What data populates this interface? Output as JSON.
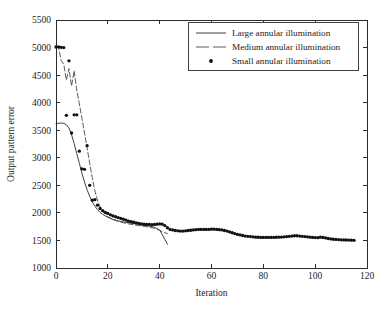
{
  "chart_data": {
    "type": "line",
    "title": "",
    "xlabel": "Iteration",
    "ylabel": "Output pattern error",
    "xlim": [
      0,
      120
    ],
    "ylim": [
      1000,
      5500
    ],
    "xticks": [
      0,
      20,
      40,
      60,
      80,
      100,
      120
    ],
    "yticks": [
      1000,
      1500,
      2000,
      2500,
      3000,
      3500,
      4000,
      4500,
      5000,
      5500
    ],
    "xtick_labels": [
      "0",
      "20",
      "40",
      "60",
      "80",
      "100",
      "120"
    ],
    "ytick_labels": [
      "1000",
      "1500",
      "2000",
      "2500",
      "3000",
      "3500",
      "4000",
      "4500",
      "5000",
      "5500"
    ],
    "grid": false,
    "legend_position": "top-right",
    "series": [
      {
        "name": "Large annular illumination",
        "style": "solid-line",
        "color": "#2a2a2a",
        "x": [
          0,
          1,
          2,
          3,
          4,
          5,
          6,
          7,
          8,
          9,
          10,
          11,
          12,
          13,
          14,
          15,
          16,
          17,
          18,
          19,
          20,
          22,
          24,
          26,
          28,
          30,
          32,
          34,
          36,
          38,
          40,
          42,
          43
        ],
        "y": [
          3620,
          3625,
          3630,
          3625,
          3600,
          3540,
          3420,
          3260,
          3080,
          2900,
          2720,
          2560,
          2420,
          2300,
          2200,
          2120,
          2060,
          2010,
          1975,
          1945,
          1920,
          1880,
          1855,
          1835,
          1820,
          1805,
          1790,
          1775,
          1760,
          1740,
          1690,
          1520,
          1430
        ]
      },
      {
        "name": "Medium annular illumination",
        "style": "dashed-line",
        "color": "#4a4a4a",
        "x": [
          0,
          1,
          2,
          3,
          4,
          5,
          6,
          7,
          8,
          9,
          10,
          11,
          12,
          13,
          14,
          15,
          16,
          17,
          18,
          20,
          22,
          24,
          26,
          28,
          30,
          32,
          34,
          36,
          38,
          40,
          42,
          43
        ],
        "y": [
          5010,
          5005,
          4760,
          4700,
          4410,
          4620,
          4300,
          4580,
          4230,
          3980,
          3720,
          3450,
          3180,
          2900,
          2640,
          2400,
          2230,
          2110,
          2030,
          1930,
          1880,
          1845,
          1820,
          1800,
          1785,
          1770,
          1755,
          1740,
          1720,
          1680,
          1640,
          1625
        ]
      },
      {
        "name": "Small annular illumination",
        "style": "dots",
        "color": "#111111",
        "x": [
          0,
          1,
          2,
          3,
          4,
          5,
          6,
          7,
          8,
          9,
          10,
          11,
          12,
          13,
          14,
          15,
          16,
          17,
          18,
          19,
          20,
          21,
          22,
          23,
          24,
          25,
          26,
          27,
          28,
          29,
          30,
          31,
          32,
          33,
          34,
          35,
          36,
          37,
          38,
          39,
          40,
          41,
          42,
          43,
          44,
          45,
          46,
          47,
          48,
          49,
          50,
          51,
          52,
          53,
          54,
          55,
          56,
          57,
          58,
          59,
          60,
          61,
          62,
          63,
          64,
          65,
          66,
          67,
          68,
          69,
          70,
          71,
          72,
          73,
          74,
          75,
          76,
          77,
          78,
          79,
          80,
          81,
          82,
          83,
          84,
          85,
          86,
          87,
          88,
          89,
          90,
          91,
          92,
          93,
          94,
          95,
          96,
          97,
          98,
          99,
          100,
          101,
          102,
          103,
          104,
          105,
          106,
          107,
          108,
          109,
          110,
          111,
          112,
          113,
          114,
          115
        ],
        "y": [
          5010,
          5010,
          5005,
          5000,
          3770,
          4760,
          3450,
          3780,
          3780,
          3120,
          2800,
          2790,
          3220,
          2500,
          2230,
          2240,
          2140,
          2080,
          2040,
          2010,
          1990,
          1965,
          1945,
          1930,
          1915,
          1900,
          1885,
          1870,
          1850,
          1840,
          1830,
          1820,
          1810,
          1800,
          1795,
          1790,
          1790,
          1785,
          1790,
          1795,
          1800,
          1795,
          1770,
          1730,
          1700,
          1690,
          1680,
          1675,
          1670,
          1670,
          1675,
          1680,
          1685,
          1690,
          1695,
          1700,
          1700,
          1700,
          1700,
          1700,
          1705,
          1705,
          1700,
          1695,
          1690,
          1680,
          1670,
          1655,
          1640,
          1625,
          1610,
          1600,
          1590,
          1580,
          1575,
          1570,
          1565,
          1560,
          1558,
          1555,
          1555,
          1555,
          1555,
          1555,
          1555,
          1558,
          1560,
          1562,
          1565,
          1570,
          1575,
          1580,
          1585,
          1585,
          1580,
          1575,
          1570,
          1565,
          1560,
          1555,
          1552,
          1550,
          1560,
          1555,
          1545,
          1535,
          1528,
          1522,
          1518,
          1515,
          1512,
          1510,
          1508,
          1506,
          1504,
          1502
        ]
      }
    ]
  },
  "legend": {
    "entries": [
      {
        "label": "Large annular illumination",
        "marker": "solid-line"
      },
      {
        "label": "Medium annular illumination",
        "marker": "dashed-line"
      },
      {
        "label": "Small annular illumination",
        "marker": "dot"
      }
    ]
  }
}
